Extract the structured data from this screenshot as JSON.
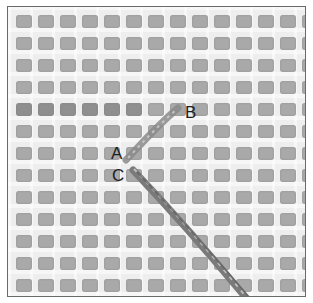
{
  "figure": {
    "labels": [
      {
        "id": "A",
        "text": "A",
        "x": 111,
        "y": 145
      },
      {
        "id": "B",
        "text": "B",
        "x": 185,
        "y": 104
      },
      {
        "id": "C",
        "text": "C",
        "x": 112,
        "y": 167
      }
    ],
    "grid": {
      "columns": 14,
      "rows": 13,
      "pitch_px": 22,
      "hole_color": "#a9a9a9",
      "thread_color": "#eeeeee"
    },
    "colors": {
      "border": "#6a6a6a",
      "yarn": "#7a7a7a",
      "yarn_highlight": "#c8c8c8"
    }
  }
}
